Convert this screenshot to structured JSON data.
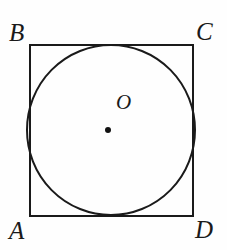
{
  "figure": {
    "kind": "geometry-diagram",
    "background_color": "#fefefe",
    "stroke_color": "#1a1a1a",
    "square": {
      "name": "square-ABCD",
      "left": 30,
      "top": 45,
      "right": 193,
      "bottom": 216,
      "stroke_width": 2,
      "fill": "none"
    },
    "circle": {
      "name": "inscribed-circle",
      "center_x": 111,
      "center_y": 130,
      "radius": 84,
      "stroke_width": 2,
      "fill": "none"
    },
    "center_point": {
      "name": "center-dot",
      "x": 108,
      "y": 130,
      "radius": 3,
      "fill": "#111111"
    },
    "labels": {
      "top_left": "B",
      "top_right": "C",
      "bottom_left": "A",
      "bottom_right": "D",
      "center": "O"
    }
  }
}
